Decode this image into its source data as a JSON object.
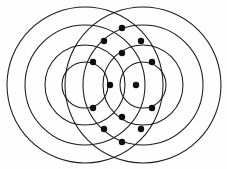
{
  "figure": {
    "name": "two-concentric-circle-families",
    "title": "Intersecting concentric circle families",
    "background_color": "#fefefe",
    "stroke_color": "#1a1a1a",
    "node_color": "#0d0d0d",
    "stroke_width": 1.05,
    "canvas": {
      "width": 227,
      "height": 169
    }
  },
  "chart_data": {
    "type": "scatter",
    "title": "Intersecting concentric circle families",
    "xlabel": "",
    "ylabel": "",
    "grid": false,
    "legend": "none",
    "xlim": [
      0,
      227
    ],
    "ylim": [
      0,
      169
    ],
    "families": [
      {
        "name": "left-family",
        "center": [
          85,
          85
        ],
        "radii": [
          23,
          40,
          60,
          78
        ]
      },
      {
        "name": "right-family",
        "center": [
          143,
          85
        ],
        "radii": [
          23,
          40,
          60,
          78
        ]
      }
    ],
    "nodes": [
      {
        "id": "n-top",
        "x": 122,
        "y": 28
      },
      {
        "id": "n-upper-left",
        "x": 104,
        "y": 41
      },
      {
        "id": "n-upper-right",
        "x": 141,
        "y": 41
      },
      {
        "id": "n-upper-mid",
        "x": 122,
        "y": 53
      },
      {
        "id": "n-left-upper",
        "x": 93,
        "y": 62
      },
      {
        "id": "n-right-upper",
        "x": 152,
        "y": 62
      },
      {
        "id": "n-left-mid",
        "x": 110,
        "y": 85
      },
      {
        "id": "n-right-mid",
        "x": 136,
        "y": 85
      },
      {
        "id": "n-left-lower",
        "x": 93,
        "y": 108
      },
      {
        "id": "n-right-lower",
        "x": 152,
        "y": 108
      },
      {
        "id": "n-lower-mid",
        "x": 122,
        "y": 117
      },
      {
        "id": "n-lower-left",
        "x": 104,
        "y": 129
      },
      {
        "id": "n-lower-right",
        "x": 141,
        "y": 129
      },
      {
        "id": "n-bottom",
        "x": 122,
        "y": 142
      }
    ],
    "node_count": 14,
    "node_radius": 3.2
  }
}
